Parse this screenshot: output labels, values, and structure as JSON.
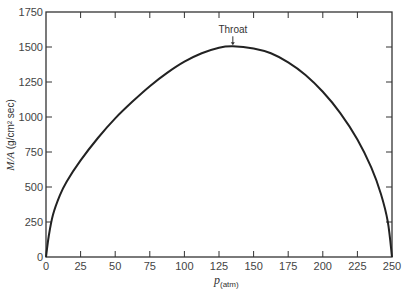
{
  "chart_data": {
    "type": "line",
    "title": "",
    "xlabel": "p(atm)",
    "xlabel_main": "p",
    "xlabel_sub": "(atm)",
    "ylabel": "M/A (g/cm² sec)",
    "ylabel_main": "M/A",
    "ylabel_units": "(g/cm² sec)",
    "xlim": [
      0,
      250
    ],
    "ylim": [
      0,
      1750
    ],
    "x_ticks": [
      0,
      25,
      50,
      75,
      100,
      125,
      150,
      175,
      200,
      225,
      250
    ],
    "y_ticks": [
      0,
      250,
      500,
      750,
      1000,
      1250,
      1500,
      1750
    ],
    "grid": false,
    "legend": null,
    "series": [
      {
        "name": "M/A",
        "x": [
          0,
          2,
          5,
          10,
          15,
          25,
          37.5,
          50,
          62.5,
          75,
          87.5,
          100,
          112.5,
          125,
          135,
          150,
          162.5,
          175,
          187.5,
          200,
          212.5,
          225,
          235,
          242,
          247,
          250
        ],
        "values": [
          0,
          150,
          300,
          440,
          540,
          690,
          850,
          990,
          1110,
          1220,
          1315,
          1395,
          1455,
          1495,
          1505,
          1490,
          1455,
          1390,
          1300,
          1180,
          1030,
          840,
          640,
          450,
          250,
          0
        ]
      }
    ],
    "annotations": [
      {
        "text": "Throat",
        "x": 135,
        "y": 1505,
        "arrow": true
      }
    ]
  }
}
